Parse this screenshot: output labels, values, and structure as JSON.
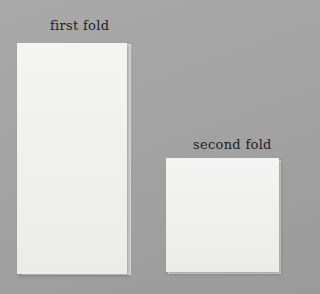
{
  "labels": {
    "first_fold": "first fold",
    "second_fold": "second fold"
  },
  "colors": {
    "background": "#a5a5a5",
    "paper": "#f1f1ef",
    "text": "#1e1e1e"
  }
}
